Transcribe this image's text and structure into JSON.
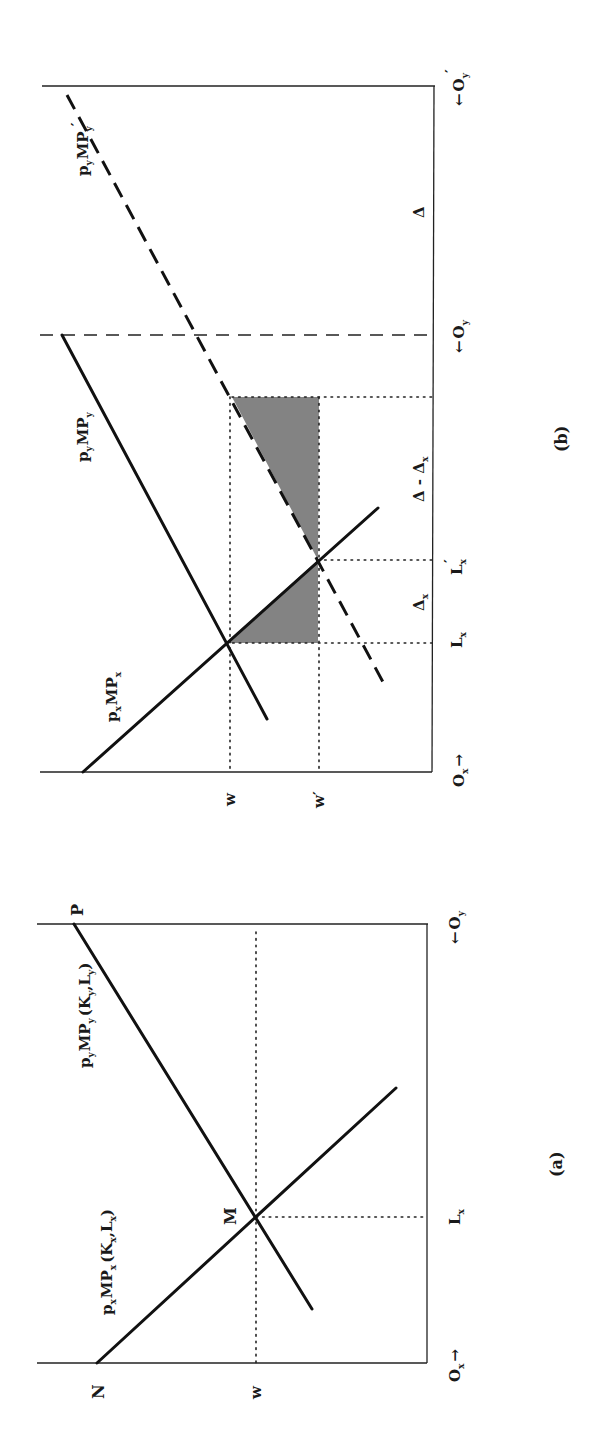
{
  "figure": {
    "orientation": "rotated 90 degrees counter-clockwise",
    "panels": [
      {
        "id": "a",
        "caption": "(a)",
        "origin_left": "O",
        "origin_left_sub": "x",
        "origin_left_arrow": "→",
        "origin_right": "O",
        "origin_right_sub": "y",
        "origin_right_arrow": "←",
        "vertical_axis_labels": {
          "top": "N",
          "wage": "w"
        },
        "top_right_label": "P",
        "intersection_label": "M",
        "horizontal_axis_label": "L",
        "horizontal_axis_label_sub": "x",
        "curves": [
          {
            "name": "p_x MP_x (K_x, L_x)",
            "label_main": "p",
            "label_sub1": "x",
            "label_mid": "MP",
            "label_sub2": "x",
            "label_args": "(K",
            "label_args_sub1": "x",
            "label_args_mid": ",L",
            "label_args_sub2": "x",
            "label_close": ")",
            "style": "solid"
          },
          {
            "name": "p_y MP_y (K_y, L_y)",
            "label_main": "p",
            "label_sub1": "y",
            "label_mid": "MP",
            "label_sub2": "y",
            "label_args": "(K",
            "label_args_sub1": "y",
            "label_args_mid": ",L",
            "label_args_sub2": "y",
            "label_close": ")",
            "style": "solid"
          }
        ]
      },
      {
        "id": "b",
        "caption": "(b)",
        "origin_left": "O",
        "origin_left_sub": "x",
        "origin_left_arrow": "→",
        "origin_mid": "O",
        "origin_mid_sub": "y",
        "origin_mid_arrow": "←",
        "origin_right": "O",
        "origin_right_sub": "y",
        "origin_right_prime": "′",
        "origin_right_arrow": "←",
        "wage_labels": {
          "w": "w",
          "w_prime": "w′"
        },
        "horizontal_labels": {
          "Lx": "L",
          "Lx_sub": "x",
          "Lx_prime": "L",
          "Lx_prime_sub": "x",
          "Lx_prime_mark": "′",
          "delta_x": "Δ",
          "delta_x_sub": "x",
          "delta_minus_delta_x": "Δ - Δ",
          "delta_minus_delta_x_sub": "x",
          "delta": "Δ"
        },
        "curves": [
          {
            "name": "p_x MP_x",
            "label_main": "p",
            "label_sub1": "x",
            "label_mid": "MP",
            "label_sub2": "x",
            "style": "solid"
          },
          {
            "name": "p_y MP_y",
            "label_main": "p",
            "label_sub1": "y",
            "label_mid": "MP",
            "label_sub2": "y",
            "style": "solid"
          },
          {
            "name": "p_y MP_y′",
            "label_main": "p",
            "label_sub1": "y",
            "label_mid": "MP",
            "label_sub2": "y",
            "label_prime": "′",
            "style": "dashed"
          }
        ],
        "shaded_regions": [
          "triangle between p_x MP_x and w′ over Δ_x",
          "region between p_y MP_y′ and w′ over Δ - Δ_x"
        ]
      }
    ]
  }
}
